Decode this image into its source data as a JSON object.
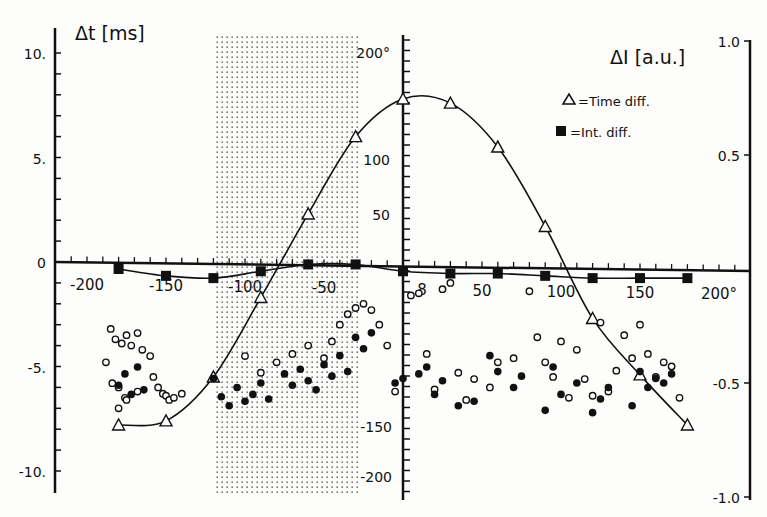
{
  "chart_data": {
    "type": "scatter",
    "title": "",
    "xlabel": "",
    "x_unit": "°",
    "x_range": [
      -220,
      215
    ],
    "x_ticks": [
      -200,
      -150,
      -100,
      -50,
      0,
      50,
      100,
      150,
      200
    ],
    "x_tick_labels": [
      "-200",
      "-150",
      "-100",
      "-50",
      "0",
      "50",
      "100",
      "150",
      "200°"
    ],
    "center_axis": {
      "tick_labels": [
        "200°",
        "100",
        "50",
        "-150",
        "-200"
      ],
      "note": "vertical angle axis at x=0 (degrees)"
    },
    "left_axis": {
      "label": "Δt [ms]",
      "ylim": [
        -10,
        10
      ],
      "ticks": [
        10,
        5,
        0,
        -5,
        -10
      ],
      "tick_labels": [
        "10.",
        "5.",
        "0",
        "-5.",
        "-10."
      ]
    },
    "right_axis": {
      "label": "ΔI [a.u.]",
      "ylim": [
        -1.0,
        1.0
      ],
      "ticks": [
        1.0,
        0.5,
        -0.5,
        -1.0
      ],
      "tick_labels": [
        "1.0",
        "0.5",
        "-0.5",
        "-1.0"
      ]
    },
    "legend": {
      "position": "upper right",
      "entries": [
        {
          "marker": "open-triangle",
          "label": "=Time diff."
        },
        {
          "marker": "filled-square",
          "label": "=Int. diff."
        }
      ]
    },
    "shaded_region": {
      "x_from": -125,
      "x_to": -30,
      "pattern": "dotted"
    },
    "series": [
      {
        "name": "Time diff.",
        "axis": "left",
        "marker": "open-triangle",
        "line": "smooth fitted curve",
        "x": [
          -180,
          -150,
          -120,
          -90,
          -60,
          -30,
          0,
          30,
          60,
          90,
          120,
          150,
          180
        ],
        "y": [
          -7.8,
          -7.6,
          -5.5,
          -1.7,
          2.3,
          6.0,
          7.8,
          7.6,
          5.5,
          1.7,
          -2.7,
          -5.4,
          -7.8
        ]
      },
      {
        "name": "Int. diff.",
        "axis": "right",
        "marker": "filled-square",
        "line": "smooth fitted curve",
        "x": [
          -180,
          -150,
          -120,
          -90,
          -60,
          -30,
          0,
          30,
          60,
          90,
          120,
          150,
          180
        ],
        "y": [
          0.0,
          -0.03,
          -0.04,
          -0.01,
          0.02,
          0.02,
          -0.01,
          -0.02,
          -0.02,
          -0.03,
          -0.04,
          -0.04,
          -0.04
        ]
      },
      {
        "name": "Open circles (individual time diff.)",
        "axis": "left",
        "marker": "open-circle",
        "x": [
          -185,
          -182,
          -178,
          -175,
          -172,
          -168,
          -165,
          -160,
          -188,
          -184,
          -180,
          -176,
          -158,
          -155,
          -152,
          -150,
          -148,
          -145,
          -140,
          -180,
          -175,
          -168,
          -100,
          -90,
          -80,
          -70,
          -60,
          -50,
          -45,
          -40,
          -35,
          -30,
          -25,
          -20,
          -15,
          -10,
          -5,
          5,
          10,
          15,
          20,
          25,
          30,
          35,
          40,
          45,
          55,
          60,
          70,
          80,
          85,
          90,
          95,
          100,
          105,
          110,
          115,
          120,
          125,
          130,
          135,
          140,
          145,
          150,
          155,
          160,
          165,
          170,
          175
        ],
        "y": [
          -3.2,
          -3.7,
          -3.9,
          -3.5,
          -4.0,
          -3.4,
          -4.2,
          -4.5,
          -4.8,
          -5.8,
          -6.0,
          -6.5,
          -5.5,
          -6.0,
          -6.3,
          -6.4,
          -6.6,
          -6.5,
          -6.3,
          -7.0,
          -6.6,
          -6.2,
          -4.5,
          -5.3,
          -4.8,
          -4.4,
          -4.0,
          -4.6,
          -3.8,
          -3.0,
          -2.5,
          -2.2,
          -2.0,
          -2.3,
          -3.0,
          -4.0,
          -6.2,
          -1.6,
          -1.5,
          -4.4,
          -6.1,
          -1.3,
          -1.0,
          -5.3,
          -6.6,
          -5.6,
          -6.0,
          -4.8,
          -4.6,
          -1.4,
          -3.6,
          -4.8,
          -5.5,
          -3.8,
          -6.5,
          -4.2,
          -5.6,
          -6.4,
          -2.9,
          -6.2,
          -5.2,
          -3.5,
          -4.6,
          -3.0,
          -4.4,
          -5.5,
          -4.8,
          -5.0,
          -6.5
        ]
      },
      {
        "name": "Filled circles (individual int. diff.)",
        "axis": "right",
        "marker": "filled-circle",
        "x": [
          -180,
          -176,
          -172,
          -168,
          -164,
          -120,
          -115,
          -110,
          -105,
          -100,
          -95,
          -90,
          -85,
          -75,
          -70,
          -65,
          -60,
          -55,
          -50,
          -45,
          -40,
          -35,
          -30,
          -25,
          -20,
          -5,
          0,
          10,
          15,
          20,
          25,
          35,
          45,
          55,
          60,
          70,
          75,
          90,
          95,
          100,
          110,
          120,
          125,
          130,
          145,
          150,
          155,
          160,
          165,
          170
        ],
        "y": [
          -0.51,
          -0.46,
          -0.55,
          -0.43,
          -0.53,
          -0.48,
          -0.56,
          -0.6,
          -0.52,
          -0.58,
          -0.55,
          -0.5,
          -0.57,
          -0.46,
          -0.51,
          -0.44,
          -0.49,
          -0.53,
          -0.42,
          -0.47,
          -0.38,
          -0.45,
          -0.3,
          -0.35,
          -0.28,
          -0.5,
          -0.48,
          -0.46,
          -0.43,
          -0.55,
          -0.49,
          -0.6,
          -0.58,
          -0.38,
          -0.45,
          -0.52,
          -0.47,
          -0.62,
          -0.43,
          -0.55,
          -0.5,
          -0.63,
          -0.57,
          -0.52,
          -0.6,
          -0.45,
          -0.52,
          -0.48,
          -0.5,
          -0.46
        ]
      }
    ]
  },
  "labels": {
    "left_axis_title": "Δt [ms]",
    "right_axis_title": "ΔI [a.u.]",
    "legend_time": "=Time diff.",
    "legend_int": "=Int. diff.",
    "left_ticks": [
      "10.",
      "5.",
      "0",
      "-5.",
      "-10."
    ],
    "right_ticks": [
      "1.0",
      "0.5",
      "-0.5",
      "-1.0"
    ],
    "x_ticks": [
      "-200",
      "-150",
      "-100",
      "-50",
      "8",
      "50",
      "100",
      "150",
      "200°"
    ],
    "center_ticks": [
      "200°",
      "100",
      "50",
      "-150",
      "-200"
    ]
  }
}
